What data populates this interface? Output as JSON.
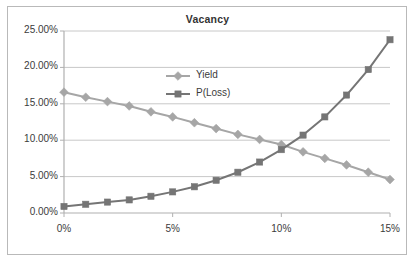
{
  "chart_data": {
    "type": "line",
    "title": "Vacancy",
    "xlabel": "",
    "ylabel": "",
    "x": [
      0,
      1,
      2,
      3,
      4,
      5,
      6,
      7,
      8,
      9,
      10,
      11,
      12,
      13,
      14,
      15
    ],
    "x_unit": "%",
    "xlim": [
      0,
      15
    ],
    "ylim": [
      0,
      25
    ],
    "y_unit": "%",
    "grid": "horizontal",
    "legend_position": "inside-upper-center",
    "xtick_labels": [
      "0%",
      "5%",
      "10%",
      "15%"
    ],
    "xtick_values": [
      0,
      5,
      10,
      15
    ],
    "ytick_labels": [
      "0.00%",
      "5.00%",
      "10.00%",
      "15.00%",
      "20.00%",
      "25.00%"
    ],
    "ytick_values": [
      0,
      5,
      10,
      15,
      20,
      25
    ],
    "series": [
      {
        "name": "Yield",
        "marker": "diamond",
        "color": "#a6a6a6",
        "values": [
          16.6,
          15.9,
          15.3,
          14.7,
          13.9,
          13.2,
          12.4,
          11.6,
          10.8,
          10.1,
          9.4,
          8.4,
          7.5,
          6.6,
          5.6,
          4.6
        ]
      },
      {
        "name": "P(Loss)",
        "marker": "square",
        "color": "#757575",
        "values": [
          0.9,
          1.2,
          1.5,
          1.8,
          2.3,
          2.9,
          3.6,
          4.5,
          5.6,
          7.0,
          8.7,
          10.7,
          13.2,
          16.2,
          19.7,
          23.8
        ]
      }
    ]
  },
  "colors": {
    "yield_series": "#a6a6a6",
    "ploss_series": "#757575",
    "gridline": "#c8c8c8",
    "axis": "#b0b0b0",
    "border": "#b9b9b9",
    "text": "#3b3b3b"
  }
}
